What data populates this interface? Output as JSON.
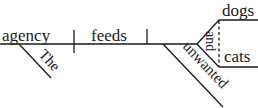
{
  "diagram": {
    "type": "Reed-Kellogg sentence diagram",
    "sentence": "The agency feeds unwanted dogs and cats",
    "subject": "agency",
    "verb": "feeds",
    "objects": [
      "dogs",
      "cats"
    ],
    "conjunction": "and",
    "modifiers": {
      "subject_modifier": "The",
      "object_modifier": "unwanted"
    },
    "colors": {
      "ink": "#1a1a1a",
      "background": "#ffffff"
    }
  }
}
